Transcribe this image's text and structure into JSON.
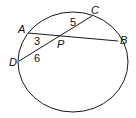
{
  "diagram": {
    "type": "circle with intersecting chords",
    "points": {
      "A": {
        "label": "A"
      },
      "B": {
        "label": "B"
      },
      "C": {
        "label": "C"
      },
      "D": {
        "label": "D"
      },
      "P": {
        "label": "P"
      }
    },
    "segments": [
      {
        "name": "PC",
        "label": "5"
      },
      {
        "name": "AP",
        "label": "3"
      },
      {
        "name": "DP",
        "label": "6"
      }
    ],
    "colors": {
      "stroke": "#1a1a1a",
      "background": "#ffffff"
    }
  }
}
